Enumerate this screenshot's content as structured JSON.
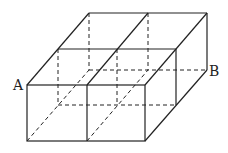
{
  "diagram": {
    "labels": [
      {
        "id": "A",
        "text": "A",
        "x": 13,
        "y": 90
      },
      {
        "id": "B",
        "text": "B",
        "x": 209,
        "y": 76
      }
    ],
    "colors": {
      "stroke": "#222222",
      "background": "#ffffff"
    }
  }
}
